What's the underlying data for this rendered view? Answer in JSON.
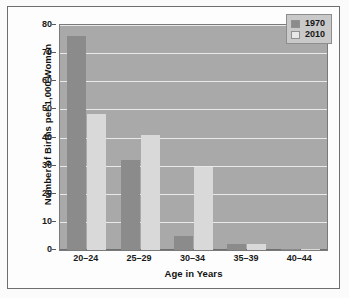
{
  "chart_data": {
    "type": "bar",
    "title": "",
    "subtitle": "",
    "xlabel": "Age in Years",
    "ylabel": "Number of Births per 1,000 Women",
    "categories": [
      "20–24",
      "25–29",
      "30–34",
      "35–39",
      "40–44"
    ],
    "series": [
      {
        "name": "1970",
        "color": "#8b8b8b",
        "values": [
          76,
          32,
          5,
          2,
          0.5
        ]
      },
      {
        "name": "2010",
        "color": "#d9d9d9",
        "values": [
          48.5,
          41,
          29.5,
          2,
          0.5
        ]
      }
    ],
    "ylim": [
      0,
      80
    ],
    "ytick_step": 10,
    "yticks": [
      80,
      70,
      60,
      50,
      40,
      30,
      20,
      10,
      0
    ],
    "ytick_labels": [
      "80",
      "70",
      "60",
      "50",
      "40",
      "30",
      "20",
      "10",
      "0"
    ],
    "grid": true,
    "grid_axis": "y",
    "legend_position": "top-right",
    "plot_background": "#a9a9a9",
    "gridline_color": "#e9e9e9",
    "figure_background": "#fdfdfd",
    "annotations": []
  },
  "legend": {
    "entries": [
      {
        "label": "1970",
        "swatch": "legend-swatch-1970"
      },
      {
        "label": "2010",
        "swatch": "legend-swatch-2010"
      }
    ]
  }
}
